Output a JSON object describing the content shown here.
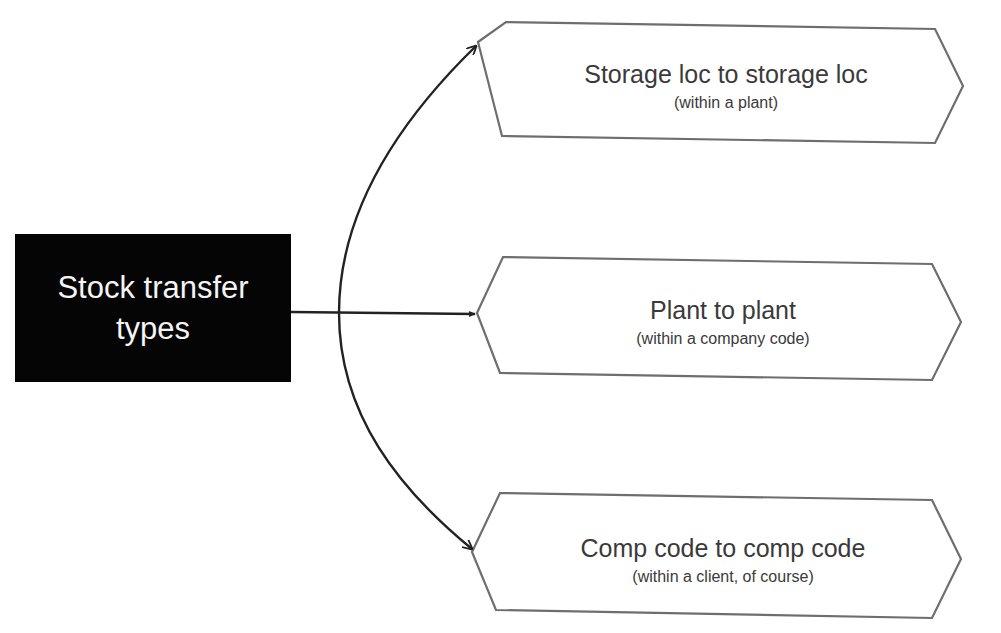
{
  "root": {
    "line1": "Stock transfer",
    "line2": "types",
    "bg_color": "#050505",
    "text_color": "#f4f4f4"
  },
  "nodes": [
    {
      "title": "Storage loc to storage loc",
      "subtitle": "(within a plant)"
    },
    {
      "title": "Plant to plant",
      "subtitle": "(within a company code)"
    },
    {
      "title": "Comp code to comp code",
      "subtitle": "(within a client, of course)"
    }
  ],
  "colors": {
    "arrow": "#222222",
    "node_border": "#6e6e6e",
    "node_text": "#3a3a3a",
    "background": "#ffffff"
  }
}
